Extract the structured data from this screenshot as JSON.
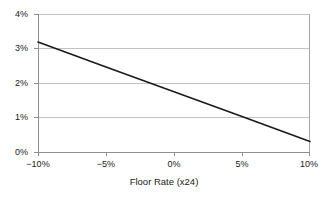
{
  "chart_data": {
    "type": "line",
    "title": "",
    "subtitle": "",
    "xlabel": "Floor Rate (x24)",
    "ylabel": "",
    "xlim": [
      -10,
      10
    ],
    "ylim": [
      0,
      4
    ],
    "xticks": [
      -10,
      -5,
      0,
      5,
      10
    ],
    "xtick_labels": [
      "−10%",
      "−5%",
      "0%",
      "5%",
      "10%"
    ],
    "yticks": [
      0,
      1,
      2,
      3,
      4
    ],
    "ytick_labels": [
      "0%",
      "1%",
      "2%",
      "3%",
      "4%"
    ],
    "grid": {
      "horizontal": true,
      "vertical": false
    },
    "legend": {
      "visible": false,
      "position": "none"
    },
    "series": [
      {
        "name": "value",
        "x": [
          -10,
          -5,
          0,
          5,
          10
        ],
        "values": [
          3.2,
          2.48,
          1.76,
          1.04,
          0.32
        ]
      }
    ],
    "annotations": [],
    "colors": {
      "line": "#1a1a1a",
      "grid": "#c0c0c0",
      "axis": "#9a9a9a",
      "background": "#ffffff",
      "text": "#1a1a1a"
    }
  }
}
